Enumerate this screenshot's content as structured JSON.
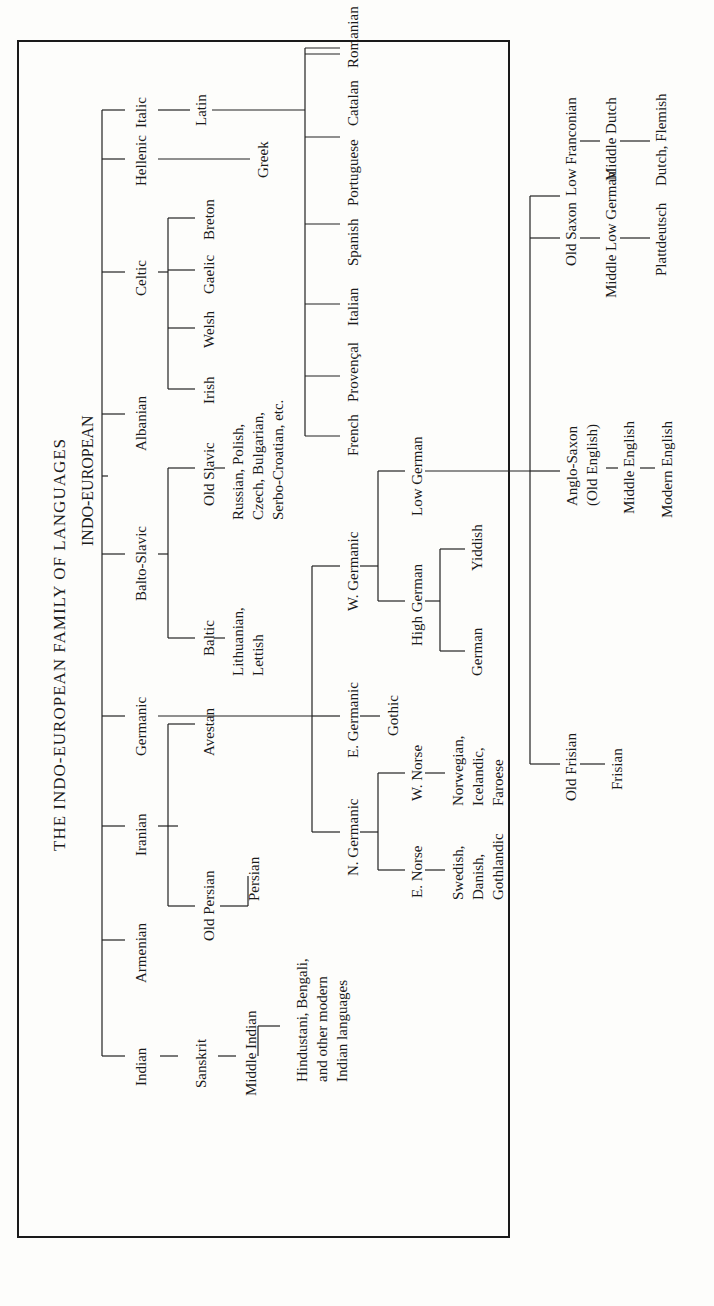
{
  "title": "THE INDO-EUROPEAN FAMILY OF LANGUAGES",
  "root": "INDO-EUROPEAN",
  "branches": {
    "indian": "Indian",
    "armenian": "Armenian",
    "iranian": "Iranian",
    "germanic": "Germanic",
    "balto_slavic": "Balto-Slavic",
    "albanian": "Albanian",
    "celtic": "Celtic",
    "hellenic": "Hellenic",
    "italic": "Italic"
  },
  "indian": {
    "sanskrit": "Sanskrit",
    "middle_indian": "Middle Indian",
    "modern": "Hindustani, Bengali,\nand other modern\nIndian languages"
  },
  "iranian": {
    "old_persian": "Old Persian",
    "avestan": "Avestan",
    "persian": "Persian"
  },
  "balto_slavic": {
    "baltic": "Baltic",
    "old_slavic": "Old Slavic",
    "baltic_modern": "Lithuanian,\nLettish",
    "slavic_modern": "Russian, Polish,\nCzech, Bulgarian,\nSerbo-Croatian, etc."
  },
  "celtic": {
    "irish": "Irish",
    "welsh": "Welsh",
    "gaelic": "Gaelic",
    "breton": "Breton"
  },
  "hellenic": {
    "greek": "Greek"
  },
  "italic": {
    "latin": "Latin",
    "romance": [
      "French",
      "Provençal",
      "Italian",
      "Spanish",
      "Portuguese",
      "Catalan",
      "Romanian"
    ]
  },
  "germanic": {
    "north": "N. Germanic",
    "east": "E. Germanic",
    "west": "W. Germanic",
    "gothic": "Gothic",
    "e_norse": "E. Norse",
    "w_norse": "W. Norse",
    "e_norse_modern": "Swedish,\nDanish,\nGothlandic",
    "w_norse_modern": "Norwegian,\nIcelandic,\nFaroese",
    "high_german": "High German",
    "low_german": "Low German",
    "german": "German",
    "yiddish": "Yiddish",
    "old_frisian": "Old Frisian",
    "frisian": "Frisian",
    "anglo_saxon": "Anglo-Saxon\n(Old English)",
    "middle_english": "Middle English",
    "modern_english": "Modern English",
    "old_saxon": "Old Saxon",
    "middle_low_german": "Middle Low German",
    "plattdeutsch": "Plattdeutsch",
    "low_franconian": "Low Franconian",
    "middle_dutch": "Middle Dutch",
    "dutch_flemish": "Dutch, Flemish"
  },
  "style": {
    "ink": "#1a1a1a",
    "paper": "#fdfdfb"
  }
}
